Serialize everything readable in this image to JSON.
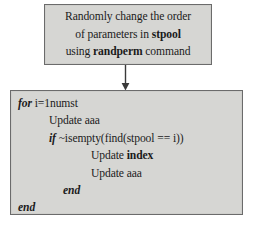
{
  "diagram": {
    "colors": {
      "box_fill": "#d6d6d3",
      "box_border": "#6b6b6b",
      "page_background": "#ffffff",
      "text": "#1b1b1b"
    },
    "process_box": {
      "lines": [
        {
          "segments": [
            {
              "text": "Randomly change the order",
              "style": "normal"
            }
          ]
        },
        {
          "segments": [
            {
              "text": "of parameters in ",
              "style": "normal"
            },
            {
              "text": "stpool",
              "style": "bold"
            }
          ]
        },
        {
          "segments": [
            {
              "text": "using ",
              "style": "normal"
            },
            {
              "text": "randperm",
              "style": "bold"
            },
            {
              "text": " command",
              "style": "normal"
            }
          ]
        }
      ],
      "line1_plain": "Randomly change the order",
      "line2_prefix": "of parameters in ",
      "line2_bold": "stpool",
      "line3_prefix": "using ",
      "line3_bold": "randperm",
      "line3_suffix": " command"
    },
    "connector": {
      "type": "arrow-down",
      "label": ""
    },
    "code_box": {
      "lines": [
        {
          "indent": 0,
          "keyword": "for",
          "rest": " i=1numst"
        },
        {
          "indent": 1,
          "keyword": "",
          "rest": "Update aaa"
        },
        {
          "indent": 1,
          "keyword": "if",
          "rest": " ~isempty(find(stpool == i))"
        },
        {
          "indent": 2,
          "keyword": "",
          "rest": "Update index"
        },
        {
          "indent": 2,
          "keyword": "",
          "rest": "Update aaa"
        },
        {
          "indent": 1,
          "keyword": "end",
          "rest": ""
        },
        {
          "indent": 0,
          "keyword": "end",
          "rest": ""
        }
      ],
      "line_for_kw": "for",
      "line_for_rest": " i=1numst",
      "line_update1": "Update aaa",
      "line_if_kw": "if",
      "line_if_rest": " ~isempty(find(stpool == i))",
      "line_update_index_prefix": "Update ",
      "line_update_index_bold": "index",
      "line_update2": "Update aaa",
      "line_end_inner": "end",
      "line_end_outer": "end"
    }
  }
}
